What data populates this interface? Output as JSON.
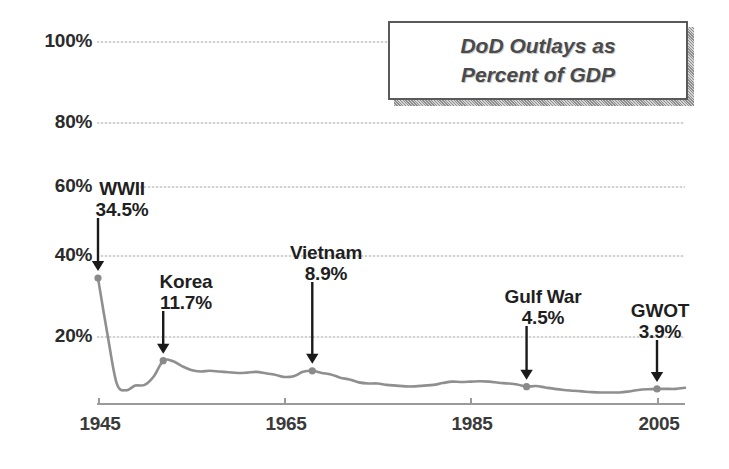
{
  "chart_data": {
    "type": "line",
    "title": "DoD Outlays as Percent of GDP",
    "title_lines": [
      "DoD Outlays as",
      "Percent of GDP"
    ],
    "xlabel": "",
    "ylabel": "",
    "xlim": [
      1945,
      2008
    ],
    "ylim": [
      0,
      100
    ],
    "grid": true,
    "legend": "none",
    "x_ticks": [
      "1945",
      "1965",
      "1985",
      "2005"
    ],
    "x_tick_values": [
      1945,
      1965,
      1985,
      2005
    ],
    "y_ticks": [
      "20%",
      "40%",
      "60%",
      "80%",
      "100%"
    ],
    "y_tick_values": [
      20,
      40,
      60,
      80,
      100
    ],
    "series": [
      {
        "name": "DoD Outlays as Percent of GDP",
        "x": [
          1945,
          1946,
          1947,
          1948,
          1949,
          1950,
          1951,
          1952,
          1953,
          1954,
          1955,
          1956,
          1957,
          1958,
          1959,
          1960,
          1961,
          1962,
          1963,
          1964,
          1965,
          1966,
          1967,
          1968,
          1969,
          1970,
          1971,
          1972,
          1973,
          1974,
          1975,
          1976,
          1977,
          1978,
          1979,
          1980,
          1981,
          1982,
          1983,
          1984,
          1985,
          1986,
          1987,
          1988,
          1989,
          1990,
          1991,
          1992,
          1993,
          1994,
          1995,
          1996,
          1997,
          1998,
          1999,
          2000,
          2001,
          2002,
          2003,
          2004,
          2005,
          2006,
          2007,
          2008
        ],
        "values": [
          34.5,
          19.2,
          5.5,
          3.5,
          4.8,
          5.0,
          7.4,
          11.7,
          11.6,
          10.2,
          9.1,
          8.7,
          8.9,
          8.7,
          8.5,
          8.3,
          8.4,
          8.6,
          8.2,
          7.8,
          7.2,
          7.4,
          8.6,
          8.9,
          8.3,
          7.9,
          7.0,
          6.5,
          5.7,
          5.4,
          5.4,
          5.0,
          4.8,
          4.6,
          4.6,
          4.8,
          5.0,
          5.5,
          5.9,
          5.8,
          5.9,
          6.0,
          5.9,
          5.6,
          5.4,
          5.1,
          4.5,
          4.7,
          4.3,
          3.9,
          3.6,
          3.4,
          3.2,
          3.0,
          2.9,
          2.9,
          2.9,
          3.2,
          3.6,
          3.8,
          3.9,
          3.9,
          3.9,
          4.2
        ]
      }
    ],
    "annotations": [
      {
        "label": "WWII",
        "value": "34.5%",
        "x": 1945,
        "y": 34.5
      },
      {
        "label": "Korea",
        "value": "11.7%",
        "x": 1952,
        "y": 11.7
      },
      {
        "label": "Vietnam",
        "value": "8.9%",
        "x": 1968,
        "y": 8.9
      },
      {
        "label": "Gulf War",
        "value": "4.5%",
        "x": 1991,
        "y": 4.5
      },
      {
        "label": "GWOT",
        "value": "3.9%",
        "x": 2005,
        "y": 3.9
      }
    ],
    "colors": {
      "line": "#8f8f8f",
      "marker": "#8a8a8a",
      "gridline": "#cfcfcf",
      "axis": "#9a9a9a",
      "text": "#2b2b2b",
      "title_text": "#4a4a4a",
      "title_border": "#5a5a5a",
      "title_shadow": "#9e9e9e",
      "background": "#ffffff"
    }
  }
}
